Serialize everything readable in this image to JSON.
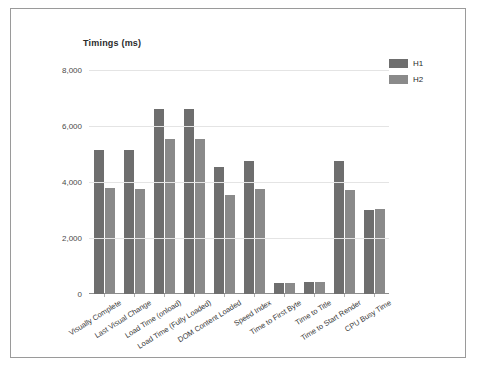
{
  "chart_data": {
    "type": "bar",
    "title": "Timings (ms)",
    "xlabel": "",
    "ylabel": "",
    "ylim": [
      0,
      8000
    ],
    "grid": true,
    "legend_position": "top-right",
    "ytick_labels": [
      "8,000",
      "6,000",
      "4,000",
      "2,000",
      "0"
    ],
    "ytick_values": [
      8000,
      6000,
      4000,
      2000,
      0
    ],
    "categories": [
      "Visually Complete",
      "Last Visual Change",
      "Load Time (onload)",
      "Load Time (Fully Loaded)",
      "DOM Content Loaded",
      "Speed Index",
      "Time to First Byte",
      "Time to Title",
      "Time to Start Render",
      "CPU Busy Time"
    ],
    "series": [
      {
        "name": "H1",
        "color": "#6e6e6e",
        "values": [
          5140,
          5140,
          6610,
          6610,
          4540,
          4750,
          380,
          440,
          4750,
          3010
        ]
      },
      {
        "name": "H2",
        "color": "#8a8a8a",
        "values": [
          3790,
          3750,
          5540,
          5540,
          3540,
          3750,
          390,
          440,
          3700,
          3030
        ]
      }
    ]
  },
  "legend": {
    "items": [
      {
        "label": "H1",
        "color": "#6e6e6e"
      },
      {
        "label": "H2",
        "color": "#8a8a8a"
      }
    ]
  },
  "colors": {
    "series_h1": "#6e6e6e",
    "series_h2": "#8a8a8a",
    "gridline": "#e4e4e4",
    "axis": "#8d8d8d",
    "frame_border": "#9a9a9a",
    "text": "#2b2b2b",
    "background": "#ffffff"
  }
}
